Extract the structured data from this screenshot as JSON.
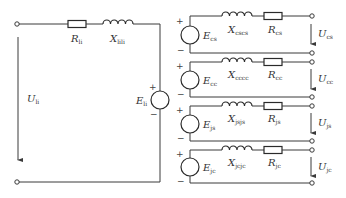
{
  "diagram": {
    "type": "equivalent-circuit",
    "colors": {
      "line": "#3a3a3a",
      "text": "#333333",
      "background": "#ffffff"
    },
    "left_circuit": {
      "resistor": {
        "symbol": "R",
        "subscript": "li"
      },
      "inductor": {
        "symbol": "X",
        "subscript": "lili"
      },
      "source": {
        "symbol": "E",
        "subscript": "li",
        "plus": "+",
        "minus": "−"
      },
      "voltage": {
        "symbol": "U",
        "subscript": "li"
      }
    },
    "branches": [
      {
        "inductor": {
          "symbol": "X",
          "subscript": "cscs"
        },
        "resistor": {
          "symbol": "R",
          "subscript": "cs"
        },
        "source": {
          "symbol": "E",
          "subscript": "cs",
          "plus": "+",
          "minus": "−"
        },
        "voltage": {
          "symbol": "U",
          "subscript": "cs"
        }
      },
      {
        "inductor": {
          "symbol": "X",
          "subscript": "cccc"
        },
        "resistor": {
          "symbol": "R",
          "subscript": "cc"
        },
        "source": {
          "symbol": "E",
          "subscript": "cc",
          "plus": "+",
          "minus": "−"
        },
        "voltage": {
          "symbol": "U",
          "subscript": "cc"
        }
      },
      {
        "inductor": {
          "symbol": "X",
          "subscript": "jsjs"
        },
        "resistor": {
          "symbol": "R",
          "subscript": "js"
        },
        "source": {
          "symbol": "E",
          "subscript": "js",
          "plus": "+",
          "minus": "−"
        },
        "voltage": {
          "symbol": "U",
          "subscript": "js"
        }
      },
      {
        "inductor": {
          "symbol": "X",
          "subscript": "jcjc"
        },
        "resistor": {
          "symbol": "R",
          "subscript": "jc"
        },
        "source": {
          "symbol": "E",
          "subscript": "jc",
          "plus": "+",
          "minus": "−"
        },
        "voltage": {
          "symbol": "U",
          "subscript": "jc"
        }
      }
    ]
  }
}
